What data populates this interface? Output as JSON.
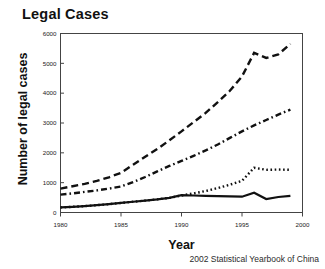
{
  "figure": {
    "title": "Legal Cases",
    "source_note": "2002 Statistical Yearbook of China"
  },
  "chart_data": {
    "type": "line",
    "title": "Legal Cases",
    "xlabel": "Year",
    "ylabel": "Number of legal cases",
    "xlim": [
      1980,
      2000
    ],
    "ylim": [
      0,
      6000
    ],
    "xticks": [
      1980,
      1985,
      1990,
      1995,
      2000
    ],
    "yticks": [
      0,
      1000,
      2000,
      3000,
      4000,
      5000,
      6000
    ],
    "xtick_labels": [
      "1980",
      "1985",
      "1990",
      "1995",
      "2000"
    ],
    "ytick_labels": [
      "0",
      "1000",
      "2000",
      "3000",
      "4000",
      "5000",
      "6000"
    ],
    "grid": false,
    "legend": "none",
    "note": "Four unlabeled series distinguished by line style: dashed (highest), dash-dot, dotted, solid (lowest). Values in units of the y-axis (number of legal cases).",
    "x": [
      1980,
      1981,
      1982,
      1983,
      1984,
      1985,
      1986,
      1987,
      1988,
      1989,
      1990,
      1991,
      1992,
      1993,
      1994,
      1995,
      1996,
      1997,
      1998,
      1999
    ],
    "series": [
      {
        "name": "series-dashed",
        "style": "dashed",
        "values": [
          800,
          880,
          960,
          1060,
          1180,
          1330,
          1600,
          1870,
          2130,
          2420,
          2720,
          3030,
          3340,
          3700,
          4080,
          4560,
          5350,
          5180,
          5300,
          5650
        ]
      },
      {
        "name": "series-dash-dot",
        "style": "dash-dot",
        "values": [
          600,
          640,
          690,
          740,
          800,
          870,
          1020,
          1190,
          1380,
          1560,
          1730,
          1900,
          2080,
          2280,
          2500,
          2720,
          2920,
          3100,
          3280,
          3450
        ]
      },
      {
        "name": "series-dotted",
        "style": "dotted",
        "values": [
          170,
          190,
          215,
          245,
          280,
          320,
          360,
          400,
          440,
          490,
          570,
          640,
          720,
          820,
          930,
          1060,
          1500,
          1430,
          1440,
          1430
        ]
      },
      {
        "name": "series-solid",
        "style": "solid",
        "values": [
          170,
          190,
          215,
          245,
          280,
          320,
          360,
          400,
          440,
          490,
          580,
          570,
          560,
          550,
          540,
          530,
          660,
          450,
          520,
          560
        ]
      }
    ]
  },
  "axes": {
    "x_label": "Year",
    "y_label": "Number of legal cases"
  },
  "colors": {
    "line": "#111111",
    "axis": "#444444",
    "background": "#ffffff"
  }
}
